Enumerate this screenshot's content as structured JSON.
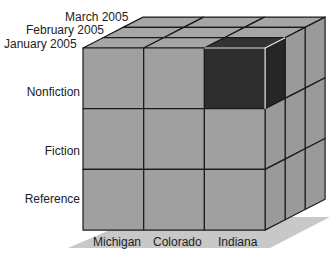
{
  "diagram": {
    "type": "data-cube",
    "colors": {
      "cell": "#a0a0a0",
      "side": "#9a9a9a",
      "top": "#a6a6a6",
      "highlight": "#2d2d2d",
      "highlight_side": "#262626",
      "highlight_top": "#333333",
      "floor": "#c8c8c8",
      "line": "#1a1a1a"
    },
    "depth_axis": {
      "labels": [
        "January 2005",
        "February 2005",
        "March 2005"
      ]
    },
    "row_axis": {
      "labels": [
        "Nonfiction",
        "Fiction",
        "Reference"
      ]
    },
    "column_axis": {
      "labels": [
        "Michigan",
        "Colorado",
        "Indiana"
      ]
    },
    "highlighted_cell": {
      "row": "Nonfiction",
      "column": "Indiana",
      "depth": "January 2005"
    }
  }
}
